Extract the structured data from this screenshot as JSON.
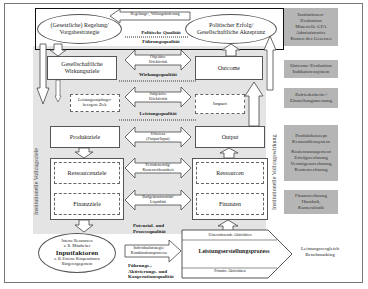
{
  "top": {
    "feedback_arrow": "Regelungs-, Vollzugsänderung",
    "left_ellipse": [
      "(Gesetzliche) Regelung/",
      "Vorgabestrategie"
    ],
    "right_ellipse": [
      "Politischer Erfolg/",
      "Gesellschaftliche Akzeptanz"
    ],
    "politische_qualitaet": "Politische Qualität",
    "fuehrungsqualitaet": "Führungsqualität"
  },
  "left_column": {
    "vertical_label": "Institutionelle Vollzugsziele",
    "gesellschaftliche_ziele": [
      "Gesellschaftliche",
      "Wirkungsziele"
    ],
    "leistungsziele": [
      "Leistungsempfänger-",
      "bezogene Ziele"
    ],
    "produktziele": "Produktziele",
    "ressourcenziele": "Ressourcenziele",
    "finanzziele": "Finanzziele"
  },
  "middle_column": {
    "objektive": [
      "Objektive",
      "Effektivität"
    ],
    "wirkungsqualitaet": "Wirkungsqualität",
    "subjektive": [
      "Subjektive",
      "Effektivität"
    ],
    "leistungsqualitaet": "Leistungsqualität",
    "effizienz": [
      "Effizienz",
      "(Output/Input)"
    ],
    "kostenwirksamkeit": [
      "Periodenerfolg/",
      "Kostenwirksamkeit"
    ],
    "budget": [
      "Budgetkonformität/",
      "Liquidität"
    ]
  },
  "right_column": {
    "vertical_label": "Institutionelle Vollzugswirkung",
    "outcome": "Outcome",
    "impact": "Impact",
    "output": "Output",
    "ressourcen": "Ressourcen",
    "finanzen": "Finanzen"
  },
  "side_panel": {
    "items": [
      [
        "Institutionen-",
        "Evaluation",
        "Materielle GFA",
        "Administrative",
        "Kosten des Gesetzes"
      ],
      [
        "Outcome-Evaluation",
        "Indikatorensystem"
      ],
      [
        "Zufriedenheits-/",
        "Einstellungsmessung"
      ],
      [
        "Produktkonzept",
        "Kennzahlensystem",
        "",
        "Kostenmanagement",
        "Erfolgsrechnung",
        "Vermögensrechnung",
        "Kostenrechnung"
      ],
      [
        "Finanzrechnung",
        "Haushalt,",
        "Kameralistik"
      ]
    ]
  },
  "bottom": {
    "input_ellipse": {
      "top": [
        "Interne Ressourcen",
        "z. B. Mitarbeiter"
      ],
      "title": "Inputfaktoren",
      "bottom": [
        "z. B. Externe Kooperationen",
        "Bürgerengagement"
      ]
    },
    "potenzial": [
      "Potenzial- und",
      "Prozessqualität"
    ],
    "kombination": [
      "Individualstrategie/",
      "Kombinationsprozesse"
    ],
    "fuehrung": [
      "Führungs-,",
      "Aktivierungs- und",
      "Kooperationsqualität"
    ],
    "process": {
      "title": "Leistungserstellungsprozess",
      "support": "Unterstützende Aktivitäten",
      "primary": "Primäre Aktivitäten",
      "upper_diag": "Effektivität",
      "lower_diag": "Effizienz"
    },
    "benchmark": [
      "Leistungsvergleich",
      "Benchmarking"
    ]
  }
}
